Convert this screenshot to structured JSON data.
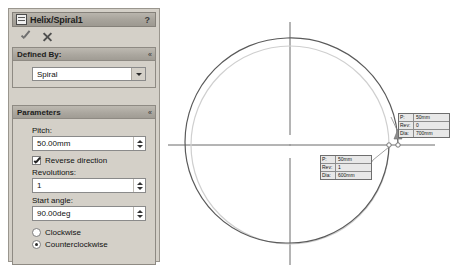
{
  "panel": {
    "title": "Helix/Spiral1",
    "title_icon": "helix-spiral-icon",
    "help_label": "?",
    "accept_icon": "check-icon",
    "cancel_icon": "x-icon",
    "collapse_glyph": "«",
    "groups": {
      "defined_by": {
        "title": "Defined By:",
        "combo_value": "Spiral",
        "combo_options": [
          "Pitch and Revolution",
          "Height and Revolution",
          "Height and Pitch",
          "Spiral"
        ]
      },
      "parameters": {
        "title": "Parameters",
        "pitch_label": "Pitch:",
        "pitch_value": "50.00mm",
        "reverse_label": "Reverse direction",
        "reverse_checked": true,
        "revolutions_label": "Revolutions:",
        "revolutions_value": "1",
        "start_angle_label": "Start angle:",
        "start_angle_value": "90.00deg",
        "direction_options": [
          {
            "label": "Clockwise",
            "selected": false
          },
          {
            "label": "Counterclockwise",
            "selected": true
          }
        ]
      }
    }
  },
  "viewport": {
    "callouts": [
      {
        "name": "callout-outer",
        "rows": [
          {
            "key": "P:",
            "value": "50mm"
          },
          {
            "key": "Rev:",
            "value": "0"
          },
          {
            "key": "Dia:",
            "value": "700mm"
          }
        ]
      },
      {
        "name": "callout-inner",
        "rows": [
          {
            "key": "P:",
            "value": "50mm"
          },
          {
            "key": "Rev:",
            "value": "1"
          },
          {
            "key": "Dia:",
            "value": "600mm"
          }
        ]
      }
    ],
    "colors": {
      "spiral_stroke": "#5a5a5a",
      "circle_stroke": "#c8c8c8",
      "centerline_stroke": "#6b6b6b",
      "leader_stroke": "#8a8a8a"
    }
  }
}
